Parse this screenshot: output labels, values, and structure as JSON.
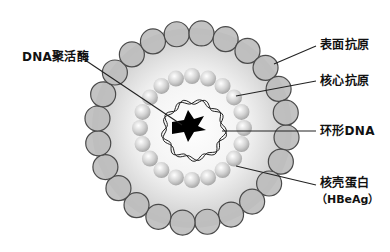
{
  "diagram": {
    "title": "",
    "center": {
      "x": 192,
      "y": 128
    },
    "envelope": {
      "ring_radius": 95,
      "bead_radius": 12.5,
      "bead_count": 24,
      "fill": "#bdbdbd",
      "stroke": "#4a4a4a",
      "background_radius": 100
    },
    "core": {
      "ring_radius": 52,
      "bead_radius": 8,
      "bead_count": 20,
      "fill": "#d6d6d6"
    },
    "labels": [
      {
        "id": "dna-polymerase",
        "text": "DNA聚活酶",
        "x": 22,
        "y": 50,
        "line": [
          85,
          60,
          182,
          125
        ]
      },
      {
        "id": "surface-antigen",
        "text": "表面抗原",
        "x": 320,
        "y": 38,
        "line": [
          316,
          46,
          274,
          64
        ]
      },
      {
        "id": "core-antigen",
        "text": "核心抗原",
        "x": 320,
        "y": 74,
        "line": [
          316,
          81,
          236,
          96
        ]
      },
      {
        "id": "circular-dna",
        "text": "环形DNA",
        "x": 320,
        "y": 124,
        "line": [
          316,
          131,
          222,
          131
        ]
      },
      {
        "id": "capsid-protein",
        "text": "核壳蛋白",
        "x": 320,
        "y": 176,
        "line": [
          316,
          185,
          236,
          166
        ]
      },
      {
        "id": "hbeag",
        "text": "（HBeAg）",
        "x": 316,
        "y": 192,
        "line": null
      }
    ],
    "colors": {
      "line": "#222222",
      "enzyme": "#000000",
      "dna": "#222222"
    }
  }
}
